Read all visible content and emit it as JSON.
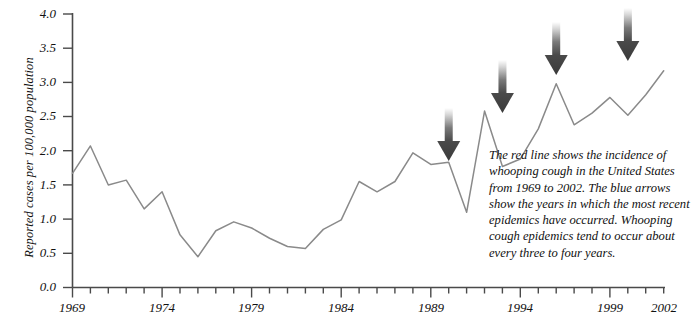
{
  "chart_data": {
    "type": "line",
    "title": "",
    "xlabel": "",
    "ylabel": "Reported cases per 100,000 population",
    "xlim": [
      1969,
      2002
    ],
    "ylim": [
      0.0,
      4.0
    ],
    "grid": false,
    "legend_position": "none",
    "line_color": "#8a8a8a",
    "x": [
      1969,
      1970,
      1971,
      1972,
      1973,
      1974,
      1975,
      1976,
      1977,
      1978,
      1979,
      1980,
      1981,
      1982,
      1983,
      1984,
      1985,
      1986,
      1987,
      1988,
      1989,
      1990,
      1991,
      1992,
      1993,
      1994,
      1995,
      1996,
      1997,
      1998,
      1999,
      2000,
      2001,
      2002
    ],
    "values": [
      1.67,
      2.07,
      1.5,
      1.57,
      1.15,
      1.4,
      0.77,
      0.45,
      0.83,
      0.96,
      0.87,
      0.72,
      0.6,
      0.57,
      0.85,
      0.99,
      1.55,
      1.4,
      1.55,
      1.97,
      1.8,
      1.83,
      1.1,
      2.58,
      1.77,
      1.88,
      2.32,
      2.98,
      2.38,
      2.55,
      2.78,
      2.52,
      2.82,
      3.17
    ],
    "yticks": [
      0.0,
      0.5,
      1.0,
      1.5,
      2.0,
      2.5,
      3.0,
      3.5,
      4.0
    ],
    "ytick_labels": [
      "0.0",
      "0.5",
      "1.0",
      "1.5",
      "2.0",
      "2.5",
      "3.0",
      "3.5",
      "4.0"
    ],
    "xticks_major": [
      1969,
      1974,
      1979,
      1984,
      1989,
      1994,
      1999,
      2002
    ],
    "xtick_labels": [
      "1969",
      "1974",
      "1979",
      "1984",
      "1989",
      "1994",
      "1999",
      "2002"
    ],
    "annotations": {
      "type": "arrow",
      "color": "#4d4d4d",
      "direction": "down",
      "years": [
        1990,
        1993,
        1996,
        2000
      ],
      "note": "epidemic years marked by arrows"
    }
  },
  "caption": {
    "text": "The red line shows the incidence of whooping cough in the United States from 1969 to 2002. The blue arrows show the years in which the most recent epidemics have occurred. Whooping cough epidemics tend to occur about every three to four years."
  }
}
